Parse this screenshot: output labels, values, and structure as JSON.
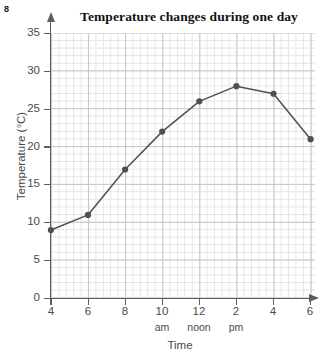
{
  "question_number": "8",
  "chart_data": {
    "type": "line",
    "title": "Temperature changes during one day",
    "xlabel": "Time",
    "ylabel": "Temperature (°C)",
    "categories": [
      "4",
      "6",
      "8",
      "10",
      "12",
      "2",
      "4",
      "6"
    ],
    "x_sublabels": [
      "",
      "",
      "",
      "am",
      "noon",
      "pm",
      "",
      ""
    ],
    "values": [
      9,
      11,
      17,
      22,
      26,
      28,
      27,
      21
    ],
    "x": [
      4,
      6,
      8,
      10,
      12,
      14,
      16,
      18
    ],
    "ylim": [
      0,
      35
    ],
    "ytick_labels": [
      "0",
      "5",
      "10",
      "15",
      "20",
      "25",
      "30",
      "35"
    ],
    "ytick_values": [
      0,
      5,
      10,
      15,
      20,
      25,
      30,
      35
    ],
    "grid": true,
    "grid_minor": true,
    "legend": "none",
    "series_color": "#4f4f57",
    "marker": "circle",
    "axis_color": "#5d5d5d",
    "grid_color": "#c9c6c9",
    "grid_minor_color": "#e6e3e6"
  }
}
